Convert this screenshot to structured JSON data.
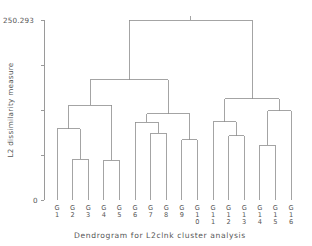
{
  "chart_data": {
    "type": "dendrogram",
    "title": "",
    "xlabel": "Dendrogram for L2clnk cluster analysis",
    "ylabel": "L2 dissimilarity measure",
    "ylim": [
      0,
      250.293
    ],
    "yticks": [
      0,
      250.293
    ],
    "ytick_labels": [
      "0",
      "250.293"
    ],
    "grid": false,
    "legend": false,
    "leaf_prefix": "G",
    "leaf_labels": [
      "G1",
      "G2",
      "G3",
      "G4",
      "G5",
      "G6",
      "G7",
      "G8",
      "G9",
      "G10",
      "G11",
      "G12",
      "G13",
      "G14",
      "G15",
      "G16"
    ],
    "leaf_numbers": [
      "1",
      "2",
      "3",
      "4",
      "5",
      "6",
      "7",
      "8",
      "9",
      "10",
      "11",
      "12",
      "13",
      "14",
      "15",
      "16"
    ],
    "leaf_order": [
      1,
      2,
      3,
      4,
      5,
      6,
      7,
      8,
      9,
      10,
      11,
      12,
      13,
      14,
      15,
      16
    ],
    "merges": [
      {
        "id": "m1",
        "left": "G2",
        "right": "G3",
        "height": 57
      },
      {
        "id": "m2",
        "left": "G1",
        "right": "m1",
        "height": 99
      },
      {
        "id": "m3",
        "left": "G4",
        "right": "G5",
        "height": 55
      },
      {
        "id": "m4",
        "left": "m2",
        "right": "m3",
        "height": 132
      },
      {
        "id": "m5",
        "left": "G7",
        "right": "G8",
        "height": 93
      },
      {
        "id": "m6",
        "left": "G6",
        "right": "m5",
        "height": 108
      },
      {
        "id": "m7",
        "left": "G9",
        "right": "G10",
        "height": 84
      },
      {
        "id": "m8",
        "left": "m6",
        "right": "m7",
        "height": 120
      },
      {
        "id": "m9",
        "left": "m4",
        "right": "m8",
        "height": 167
      },
      {
        "id": "m10",
        "left": "G12",
        "right": "G13",
        "height": 89
      },
      {
        "id": "m11",
        "left": "G11",
        "right": "m10",
        "height": 109
      },
      {
        "id": "m12",
        "left": "G14",
        "right": "G15",
        "height": 76
      },
      {
        "id": "m13",
        "left": "m12",
        "right": "G16",
        "height": 124
      },
      {
        "id": "m14",
        "left": "m11",
        "right": "m13",
        "height": 141
      },
      {
        "id": "m15",
        "left": "m9",
        "right": "m14",
        "height": 250.293
      }
    ],
    "axis_color": "#9a9a9a",
    "link_color": "#8d8d8d",
    "text_color": "#555555",
    "background": "#ffffff"
  }
}
